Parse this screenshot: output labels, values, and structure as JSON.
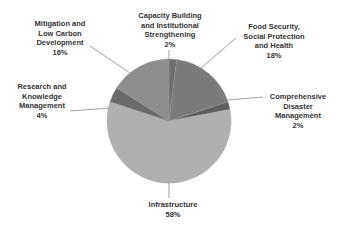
{
  "chart_data": {
    "type": "pie",
    "title": "",
    "slices": [
      {
        "label": "Capacity Building and Institutional Strengthening",
        "value": 2,
        "color": "#6e6e6e"
      },
      {
        "label": "Food Security, Social Protection and Health",
        "value": 18,
        "color": "#7b7b7b"
      },
      {
        "label": "Comprehensive Disaster Management",
        "value": 2,
        "color": "#5f5f5f"
      },
      {
        "label": "Infrastructure",
        "value": 58,
        "color": "#b0b0b0"
      },
      {
        "label": "Research and Knowledge Management",
        "value": 4,
        "color": "#6a6a6a"
      },
      {
        "label": "Mitigation and Low Carbon Development",
        "value": 16,
        "color": "#8e8e8e"
      }
    ]
  },
  "labels": {
    "capacity": "Capacity Building\nand Institutional\nStrengthening\n2%",
    "food": "Food Security,\nSocial Protection\nand Health\n18%",
    "disaster": "Comprehensive\nDisaster\nManagement\n2%",
    "infra": "Infrastructure\n58%",
    "research": "Research and\nKnowledge\nManagement\n4%",
    "mitigation": "Mitigation and\nLow Carbon\nDevelopment\n16%"
  }
}
